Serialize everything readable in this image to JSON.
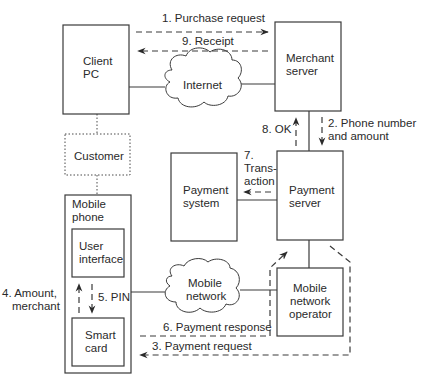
{
  "diagram": {
    "nodes": {
      "client_pc": {
        "line1": "Client",
        "line2": "PC"
      },
      "merchant_server": {
        "line1": "Merchant",
        "line2": "server"
      },
      "internet": {
        "label": "Internet"
      },
      "customer": {
        "label": "Customer"
      },
      "mobile_phone": {
        "line1": "Mobile",
        "line2": "phone"
      },
      "user_interface": {
        "line1": "User",
        "line2": "interface"
      },
      "smart_card": {
        "line1": "Smart",
        "line2": "card"
      },
      "payment_system": {
        "line1": "Payment",
        "line2": "system"
      },
      "payment_server": {
        "line1": "Payment",
        "line2": "server"
      },
      "mobile_network": {
        "line1": "Mobile",
        "line2": "network"
      },
      "mobile_network_operator": {
        "line1": "Mobile",
        "line2": "network",
        "line3": "operator"
      }
    },
    "messages": {
      "m1": "1. Purchase request",
      "m2_line1": "2. Phone number",
      "m2_line2": "and amount",
      "m3": "3. Payment request",
      "m4_line1": "4. Amount,",
      "m4_line2": "merchant",
      "m5": "5. PIN",
      "m6": "6. Payment response",
      "m7_line1": "7.",
      "m7_line2": "Trans-",
      "m7_line3": "action",
      "m8": "8. OK",
      "m9": "9. Receipt"
    }
  }
}
